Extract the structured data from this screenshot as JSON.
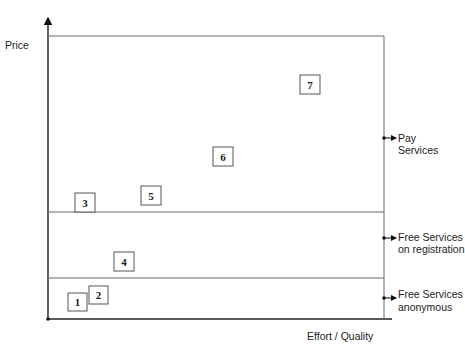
{
  "diagram": {
    "y_axis_label": "Price",
    "x_axis_label": "Effort / Quality",
    "bands": [
      {
        "id": "pay",
        "label_lines": [
          "Pay",
          "Services"
        ]
      },
      {
        "id": "free-registration",
        "label_lines": [
          "Free Services",
          "on registration"
        ]
      },
      {
        "id": "free-anonymous",
        "label_lines": [
          "Free Services",
          "anonymous"
        ]
      }
    ],
    "items": [
      {
        "label": "1"
      },
      {
        "label": "2"
      },
      {
        "label": "3"
      },
      {
        "label": "4"
      },
      {
        "label": "5"
      },
      {
        "label": "6"
      },
      {
        "label": "7"
      }
    ]
  }
}
